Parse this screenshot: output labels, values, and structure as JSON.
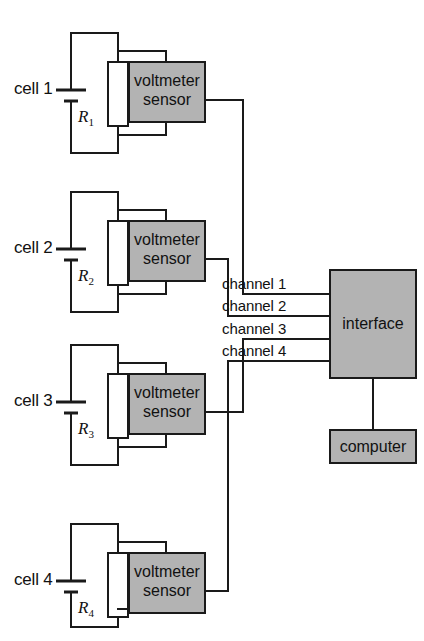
{
  "diagram": {
    "cells": [
      {
        "cell_label": "cell 1",
        "resistor_symbol": "R",
        "resistor_subscript": "1",
        "sensor_line1": "voltmeter",
        "sensor_line2": "sensor",
        "connects_to": "channel 1"
      },
      {
        "cell_label": "cell 2",
        "resistor_symbol": "R",
        "resistor_subscript": "2",
        "sensor_line1": "voltmeter",
        "sensor_line2": "sensor",
        "connects_to": "channel 2"
      },
      {
        "cell_label": "cell 3",
        "resistor_symbol": "R",
        "resistor_subscript": "3",
        "sensor_line1": "voltmeter",
        "sensor_line2": "sensor",
        "connects_to": "channel 3"
      },
      {
        "cell_label": "cell 4",
        "resistor_symbol": "R",
        "resistor_subscript": "4",
        "sensor_line1": "voltmeter",
        "sensor_line2": "sensor",
        "connects_to": "channel 4"
      }
    ],
    "channels": [
      {
        "label": "channel 1"
      },
      {
        "label": "channel 2"
      },
      {
        "label": "channel 3"
      },
      {
        "label": "channel 4"
      }
    ],
    "interface": {
      "label": "interface"
    },
    "computer": {
      "label": "computer"
    },
    "colors": {
      "box_fill": "#b3b3b3",
      "stroke": "#1a1a1a",
      "background": "#ffffff",
      "resistor_fill": "#ffffff"
    }
  }
}
